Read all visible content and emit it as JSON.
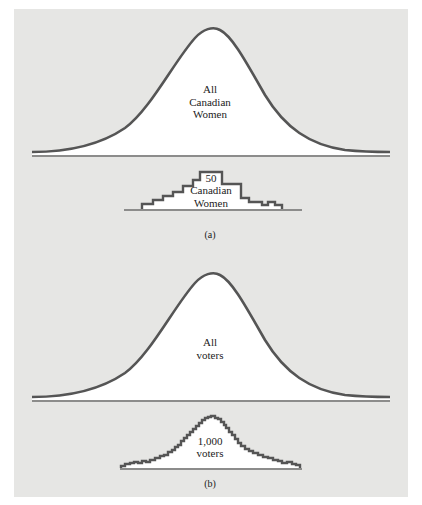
{
  "figure": {
    "colors": {
      "panel_background": "#e6e6e4",
      "curve_stroke": "#555555",
      "fill": "#ffffff",
      "baseline": "#333333",
      "text": "#222222"
    },
    "part_a": {
      "label": "(a)",
      "population": {
        "label_lines": [
          "All",
          "Canadian",
          "Women"
        ],
        "shape": "normal-curve"
      },
      "sample": {
        "label_lines": [
          "50",
          "Canadian",
          "Women"
        ],
        "shape": "step-histogram",
        "bin_heights": [
          1,
          2,
          3,
          4,
          5,
          6,
          8,
          6,
          4,
          3,
          2,
          2,
          3,
          1
        ]
      }
    },
    "part_b": {
      "label": "(b)",
      "population": {
        "label_lines": [
          "All",
          "voters"
        ],
        "shape": "normal-curve"
      },
      "sample": {
        "label_lines": [
          "1,000",
          "voters"
        ],
        "shape": "fine-step-histogram"
      }
    }
  }
}
